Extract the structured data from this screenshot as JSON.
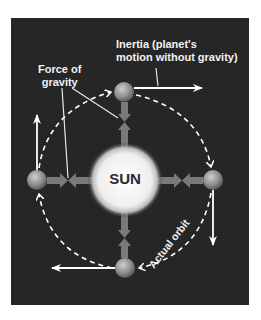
{
  "diagram": {
    "sun_label": "SUN",
    "labels": {
      "inertia_line1": "Inertia (planet's",
      "inertia_line2": "motion without gravity)",
      "gravity_line1": "Force of",
      "gravity_line2": "gravity",
      "orbit": "Actual orbit"
    },
    "planets": [
      {
        "position": "top",
        "inertia_direction": "right"
      },
      {
        "position": "right",
        "inertia_direction": "down"
      },
      {
        "position": "bottom",
        "inertia_direction": "left"
      },
      {
        "position": "left",
        "inertia_direction": "up"
      }
    ],
    "colors": {
      "background": "#262626",
      "text": "#f2f2f2",
      "sun": "#f0f0f0",
      "gravity_arrow": "#7a7a7a",
      "planet": "#9a9a9a"
    }
  }
}
